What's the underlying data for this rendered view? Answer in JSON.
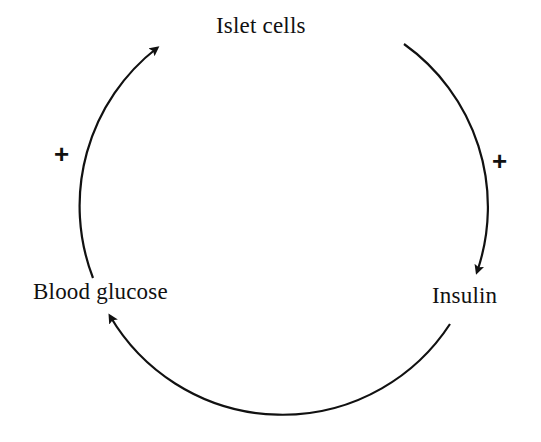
{
  "diagram": {
    "type": "feedback-loop",
    "nodes": [
      {
        "id": "islet",
        "label": "Islet cells"
      },
      {
        "id": "insulin",
        "label": "Insulin"
      },
      {
        "id": "glucose",
        "label": "Blood glucose"
      }
    ],
    "edges": [
      {
        "from": "islet",
        "to": "insulin",
        "sign": "+"
      },
      {
        "from": "insulin",
        "to": "glucose",
        "sign": ""
      },
      {
        "from": "glucose",
        "to": "islet",
        "sign": "+"
      }
    ],
    "signs": {
      "left": "+",
      "right": "+"
    },
    "colors": {
      "ink": "#111111",
      "background": "#ffffff"
    }
  }
}
